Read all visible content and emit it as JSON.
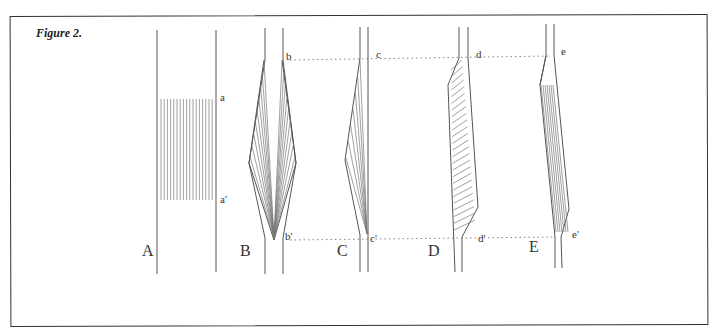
{
  "figure": {
    "title": "Figure 2.",
    "panels": [
      {
        "id": "A",
        "label": "A",
        "marks": [
          "a",
          "a'"
        ]
      },
      {
        "id": "B",
        "label": "B",
        "marks": [
          "b",
          "b'"
        ]
      },
      {
        "id": "C",
        "label": "C",
        "marks": [
          "c",
          "c'"
        ]
      },
      {
        "id": "D",
        "label": "D",
        "marks": [
          "d",
          "d'"
        ]
      },
      {
        "id": "E",
        "label": "E",
        "marks": [
          "e",
          "e'"
        ]
      }
    ]
  }
}
